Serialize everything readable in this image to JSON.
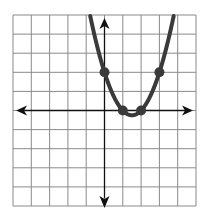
{
  "chart_data": {
    "type": "line",
    "title": "",
    "xlabel": "",
    "ylabel": "",
    "xlim": [
      -5,
      5
    ],
    "ylim": [
      -5,
      5
    ],
    "grid": true,
    "grid_step": 1,
    "axes_arrows": true,
    "series": [
      {
        "name": "parabola",
        "function": "y = x^2 - 3x + 2",
        "vertex": [
          1.5,
          -0.25
        ],
        "color": "#3a3a3a"
      }
    ],
    "points": [
      {
        "x": 0,
        "y": 2
      },
      {
        "x": 1,
        "y": 0
      },
      {
        "x": 2,
        "y": 0
      },
      {
        "x": 3,
        "y": 2
      }
    ]
  },
  "colors": {
    "grid": "#8a8a8a",
    "axis": "#111111",
    "curve": "#3a3a3a",
    "point": "#3a3a3a",
    "background": "#ffffff"
  },
  "layout": {
    "left": 13,
    "top": 15,
    "right": 196,
    "bottom": 206
  }
}
